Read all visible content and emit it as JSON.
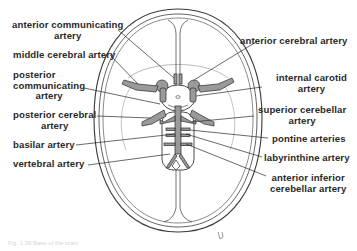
{
  "figure": {
    "caption": "Fig. 1.39 Base of the brain",
    "colors": {
      "ink": "#2a2a2a",
      "line": "#3a3a3a",
      "vessel_fill": "#9a9a9a",
      "background": "#ffffff",
      "caption": "#d6d6d6"
    }
  },
  "labels_left": [
    {
      "id": "anterior-communicating-artery",
      "line1": "anterior communicating",
      "line2": "artery"
    },
    {
      "id": "middle-cerebral-artery",
      "line1": "middle cerebral artery"
    },
    {
      "id": "posterior-communicating-artery",
      "line1": "posterior",
      "line2": "communicating",
      "line3": "artery"
    },
    {
      "id": "posterior-cerebral-artery",
      "line1": "posterior cerebral",
      "line2": "artery"
    },
    {
      "id": "basilar-artery",
      "line1": "basilar artery"
    },
    {
      "id": "vertebral-artery",
      "line1": "vertebral artery"
    }
  ],
  "labels_right": [
    {
      "id": "anterior-cerebral-artery",
      "line1": "anterior cerebral artery"
    },
    {
      "id": "internal-carotid-artery",
      "line1": "internal carotid",
      "line2": "artery"
    },
    {
      "id": "superior-cerebellar-artery",
      "line1": "superior cerebellar",
      "line2": "artery"
    },
    {
      "id": "pontine-arteries",
      "line1": "pontine arteries"
    },
    {
      "id": "labyrinthine-artery",
      "line1": "labyrinthine artery"
    },
    {
      "id": "anterior-inferior-cerebellar-artery",
      "line1": "anterior inferior",
      "line2": "cerebellar artery"
    }
  ]
}
